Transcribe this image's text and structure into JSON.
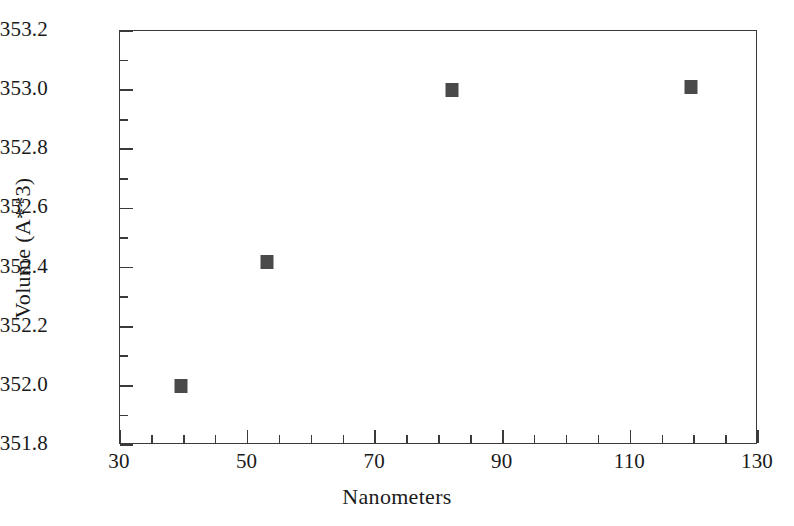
{
  "chart_data": {
    "type": "scatter",
    "title": "",
    "xlabel": "Nanometers",
    "ylabel": "Volume (A**3)",
    "xlim": [
      30,
      130
    ],
    "ylim": [
      351.8,
      353.2
    ],
    "grid": false,
    "legend": null,
    "x": [
      39.5,
      53.0,
      82.0,
      119.5
    ],
    "y": [
      352.0,
      352.42,
      353.0,
      353.01
    ],
    "points": [
      {
        "x": 39.5,
        "y": 352.0
      },
      {
        "x": 53.0,
        "y": 352.42
      },
      {
        "x": 82.0,
        "y": 353.0
      },
      {
        "x": 119.5,
        "y": 353.01
      }
    ],
    "marker": {
      "shape": "square",
      "color": "#4a4a4a",
      "size_px": 13
    },
    "x_ticks_major": [
      30,
      50,
      70,
      90,
      110,
      130
    ],
    "x_ticks_major_labels": [
      "30",
      "50",
      "70",
      "90",
      "110",
      "130"
    ],
    "x_ticks_minor": [
      35,
      40,
      45,
      55,
      60,
      65,
      75,
      80,
      85,
      95,
      100,
      105,
      115,
      120,
      125
    ],
    "y_ticks_major": [
      351.8,
      352.0,
      352.2,
      352.4,
      352.6,
      352.8,
      353.0,
      353.2
    ],
    "y_ticks_major_labels": [
      "351.8",
      "352.0",
      "352.2",
      "352.4",
      "352.6",
      "352.8",
      "353.0",
      "353.2"
    ],
    "y_ticks_minor": [
      351.9,
      352.1,
      352.3,
      352.5,
      352.7,
      352.9,
      353.1
    ],
    "axis_color": "#3a3a3a",
    "background_color": "#ffffff"
  }
}
